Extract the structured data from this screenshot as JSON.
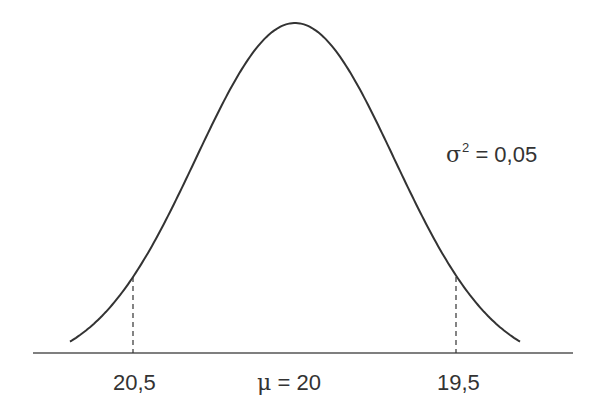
{
  "chart_data": {
    "type": "line",
    "mean": 20,
    "variance": 0.05,
    "markers": [
      20.5,
      19.5
    ],
    "tick_labels": [
      "20,5",
      "μ = 20",
      "19,5"
    ],
    "annotations": [
      "σ² = 0,05"
    ],
    "grid": false,
    "legend": null
  },
  "labels": {
    "left_tick": "20,5",
    "center_symbol": "μ",
    "center_value": "= 20",
    "right_tick": "19,5",
    "variance_symbol": "σ",
    "variance_exponent": "2",
    "variance_value": "= 0,05"
  },
  "colors": {
    "curve": "#333333",
    "axis": "#555555",
    "text": "#333333"
  }
}
